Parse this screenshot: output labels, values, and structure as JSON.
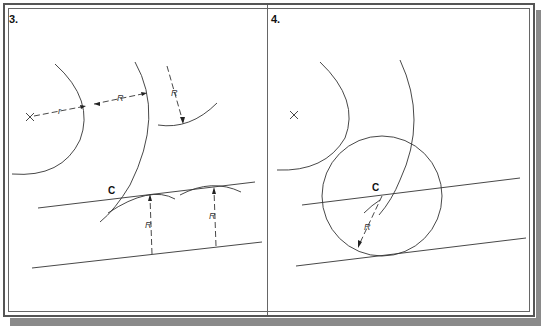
{
  "figure": {
    "panels": [
      {
        "id": "panel-3",
        "label": "3.",
        "center_mark": "x-mark",
        "dimension_labels": [
          "r",
          "R",
          "R",
          "R",
          "R"
        ],
        "point_label": "C"
      },
      {
        "id": "panel-4",
        "label": "4.",
        "center_mark": "x-mark",
        "dimension_labels": [
          "R"
        ],
        "point_label": "C"
      }
    ],
    "labels": {
      "p3_small_r": "r",
      "p3_big_R1": "R",
      "p3_big_R2": "R",
      "p3_R_left": "R",
      "p3_R_right": "R",
      "p3_C": "C",
      "p4_C": "C",
      "p4_R": "R"
    }
  },
  "colors": {
    "line": "#333333",
    "frame": "#555555",
    "shadow": "#8a8a8a"
  }
}
